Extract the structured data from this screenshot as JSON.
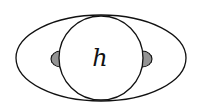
{
  "diagram": {
    "type": "schematic-drawing",
    "center_label": "h",
    "shapes": {
      "outer_ellipse": {
        "cx": 101,
        "cy": 58,
        "rx": 85,
        "ry": 43
      },
      "inner_circle": {
        "cx": 101,
        "cy": 58,
        "r": 42
      },
      "left_lobe": {
        "side": "left",
        "hatched": true
      },
      "right_lobe": {
        "side": "right",
        "hatched": true
      }
    },
    "colors": {
      "stroke": "#111111",
      "background": "#ffffff"
    }
  }
}
